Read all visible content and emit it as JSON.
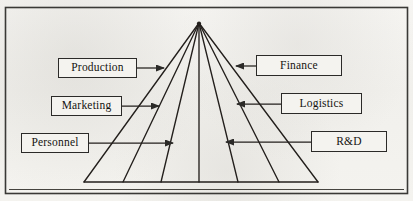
{
  "diagram": {
    "type": "pyramid-funnel",
    "background_color": "#f3f3f0",
    "line_color": "#2b2a28",
    "text_color": "#15140f",
    "frame": {
      "name": "outer-border",
      "x": 5,
      "y": 7,
      "width": 403,
      "height": 187
    },
    "pyramid": {
      "apex": {
        "x": 199,
        "y": 23
      },
      "base_left": {
        "x": 84,
        "y": 182
      },
      "base_right": {
        "x": 318,
        "y": 182
      },
      "ray_count": 7,
      "segment_count": 6,
      "base_endpoints_x": [
        84,
        123,
        161,
        199,
        238,
        279,
        318
      ]
    },
    "baseline": {
      "y": 189,
      "x_start": 10,
      "x_end": 403
    }
  },
  "labels": {
    "left": [
      {
        "id": "production",
        "text": "Production",
        "arrow": "right",
        "arrow_to_x": 164,
        "row_y": 68
      },
      {
        "id": "marketing",
        "text": "Marketing",
        "arrow": "right",
        "arrow_to_x": 159,
        "row_y": 106
      },
      {
        "id": "personnel",
        "text": "Personnel",
        "arrow": "right",
        "arrow_to_x": 173,
        "row_y": 143
      }
    ],
    "right": [
      {
        "id": "finance",
        "text": "Finance",
        "arrow": "left",
        "arrow_to_x": 236,
        "row_y": 66
      },
      {
        "id": "logistics",
        "text": "Logistics",
        "arrow": "left",
        "arrow_to_x": 237,
        "row_y": 104
      },
      {
        "id": "rnd",
        "text": "R&D",
        "arrow": "left",
        "arrow_to_x": 226,
        "row_y": 142
      }
    ]
  }
}
